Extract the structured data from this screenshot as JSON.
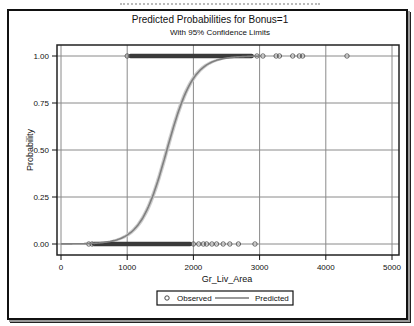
{
  "chart_data": {
    "type": "line",
    "title": "Predicted Probabilities for Bonus=1",
    "subtitle": "With 95% Confidence Limits",
    "xlabel": "Gr_Liv_Area",
    "ylabel": "Probability",
    "xlim": [
      0,
      5000
    ],
    "ylim": [
      0,
      1
    ],
    "x_ticks": [
      0,
      1000,
      2000,
      3000,
      4000,
      5000
    ],
    "x_tick_labels": [
      "0",
      "1000",
      "2000",
      "3000",
      "4000",
      "5000"
    ],
    "y_ticks": [
      0,
      0.25,
      0.5,
      0.75,
      1.0
    ],
    "y_tick_labels": [
      "0.00",
      "0.25",
      "0.50",
      "0.75",
      "1.00"
    ],
    "grid": true,
    "legend_position": "bottom",
    "legend": [
      {
        "label": "Observed",
        "marker": "circle"
      },
      {
        "label": "Predicted",
        "marker": "line"
      }
    ],
    "series": [
      {
        "name": "Predicted",
        "type": "logistic-curve",
        "midpoint_x": 1600,
        "x_at_p25": 1390,
        "x_at_p75": 1830,
        "has_confidence_band": true,
        "color": "#808080"
      },
      {
        "name": "Observed",
        "type": "scatter",
        "y1_dense_range": [
          1050,
          2880
        ],
        "y1_points": [
          1000,
          2960,
          3050,
          3250,
          3300,
          3500,
          3600,
          3650,
          4320
        ],
        "y0_dense_range": [
          500,
          1950
        ],
        "y0_points": [
          420,
          470,
          2000,
          2080,
          2150,
          2200,
          2280,
          2350,
          2450,
          2550,
          2680,
          2930
        ],
        "color": "#555555"
      }
    ]
  }
}
